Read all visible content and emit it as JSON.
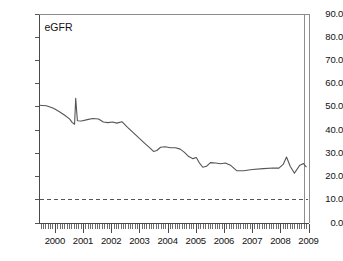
{
  "chart_data": {
    "type": "line",
    "title": "",
    "series_label": "eGFR",
    "xlabel": "",
    "ylabel": "",
    "ylim": [
      0.0,
      90.0
    ],
    "xlim": [
      1999.42,
      2009.0
    ],
    "ytick_labels": [
      "90.0",
      "80.0",
      "70.0",
      "60.0",
      "50.0",
      "40.0",
      "30.0",
      "20.0",
      "10.0",
      "0.0"
    ],
    "ytick_values": [
      90.0,
      80.0,
      70.0,
      60.0,
      50.0,
      40.0,
      30.0,
      20.0,
      10.0,
      0.0
    ],
    "xtick_labels": [
      "2000",
      "2001",
      "2002",
      "2003",
      "2004",
      "2005",
      "2006",
      "2007",
      "2008",
      "2009"
    ],
    "xtick_values": [
      2000,
      2001,
      2002,
      2003,
      2004,
      2005,
      2006,
      2007,
      2008,
      2009
    ],
    "grid": false,
    "legend": "none",
    "minor_ticks_per_year": 12,
    "reference_line": {
      "label": "threshold",
      "value": 10.0,
      "style": "dashed",
      "color": "#555555"
    },
    "series": [
      {
        "name": "eGFR",
        "color": "#555555",
        "x": [
          1999.45,
          1999.7,
          1999.95,
          2000.15,
          2000.35,
          2000.52,
          2000.62,
          2000.7,
          2000.74,
          2000.8,
          2000.95,
          2001.15,
          2001.35,
          2001.55,
          2001.72,
          2001.88,
          2002.05,
          2002.2,
          2002.38,
          2002.58,
          2002.8,
          2003.0,
          2003.2,
          2003.38,
          2003.5,
          2003.62,
          2003.75,
          2003.92,
          2004.1,
          2004.28,
          2004.45,
          2004.6,
          2004.75,
          2004.9,
          2005.02,
          2005.12,
          2005.25,
          2005.38,
          2005.52,
          2005.7,
          2005.88,
          2006.05,
          2006.25,
          2006.45,
          2006.7,
          2007.0,
          2007.4,
          2007.75,
          2007.95,
          2008.1,
          2008.22,
          2008.35,
          2008.5,
          2008.68,
          2008.82,
          2008.92
        ],
        "y": [
          50.5,
          50.3,
          49.2,
          47.8,
          46.2,
          44.6,
          43.0,
          42.3,
          53.5,
          43.8,
          43.7,
          44.3,
          44.8,
          44.6,
          43.3,
          43.0,
          43.3,
          42.8,
          43.4,
          41.0,
          38.5,
          36.2,
          34.0,
          32.0,
          30.6,
          31.0,
          32.4,
          32.6,
          32.2,
          32.2,
          31.6,
          30.2,
          28.4,
          27.5,
          28.0,
          25.8,
          23.8,
          24.2,
          25.8,
          25.6,
          25.3,
          25.6,
          24.5,
          22.3,
          22.3,
          22.8,
          23.2,
          23.5,
          23.4,
          25.0,
          28.2,
          24.2,
          21.2,
          24.5,
          25.4,
          24.0
        ]
      }
    ]
  },
  "annotations": {
    "series_caption": "eGFR"
  }
}
